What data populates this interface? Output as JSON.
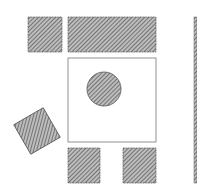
{
  "diagram": {
    "colors": {
      "hatch": "#6e6e6e",
      "outline": "#555555",
      "background": "#ffffff"
    },
    "elements": [
      {
        "name": "chair-top-left",
        "shape": "rect",
        "x": 28,
        "y": 17,
        "w": 34,
        "h": 35,
        "fill": "hatched"
      },
      {
        "name": "bench-top",
        "shape": "rect",
        "x": 68,
        "y": 17,
        "w": 88,
        "h": 35,
        "fill": "hatched"
      },
      {
        "name": "table",
        "shape": "rect",
        "x": 68,
        "y": 58,
        "w": 88,
        "h": 84,
        "fill": "none"
      },
      {
        "name": "centerpiece",
        "shape": "circle",
        "cx": 104,
        "cy": 89,
        "r": 17,
        "fill": "hatched"
      },
      {
        "name": "chair-rotated",
        "shape": "rect",
        "cx": 37,
        "cy": 131,
        "w": 34,
        "h": 34,
        "rotate": -30,
        "fill": "hatched"
      },
      {
        "name": "chair-bottom-left",
        "shape": "rect",
        "x": 68,
        "y": 148,
        "w": 32,
        "h": 35,
        "fill": "hatched"
      },
      {
        "name": "chair-bottom-right",
        "shape": "rect",
        "x": 123,
        "y": 148,
        "w": 33,
        "h": 35,
        "fill": "hatched"
      },
      {
        "name": "wall",
        "shape": "rect",
        "x": 194,
        "y": 17,
        "w": 3,
        "h": 166,
        "fill": "hatched"
      }
    ]
  }
}
